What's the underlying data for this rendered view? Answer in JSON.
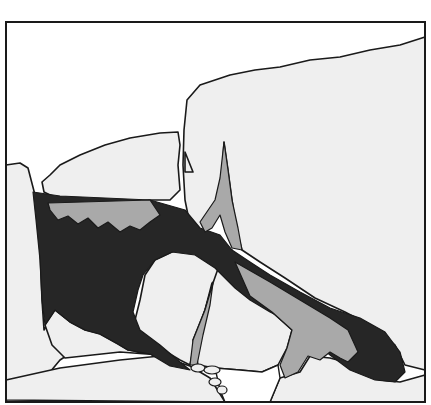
{
  "diagram": {
    "type": "line-drawing",
    "colors": {
      "background": "#ffffff",
      "stone_fill": "#efefef",
      "light_gray_fill": "#a9a9a9",
      "dark_fill": "#262626",
      "outline": "#1a1a1a",
      "gap_white": "#ffffff"
    },
    "frame": {
      "x": 6,
      "y": 22,
      "width": 419,
      "height": 380
    },
    "regions": [
      {
        "id": "dark-cavity",
        "fill": "dark_fill",
        "d": "M33,192 L60,196 L150,200 L185,210 L200,228 L220,235 L232,250 L250,262 L270,275 L300,292 L330,308 L360,318 L385,332 L400,352 L405,372 L395,382 L375,380 L350,370 L330,355 L310,338 L290,322 L270,312 L250,300 L235,288 L215,268 L195,255 L172,252 L155,260 L143,275 L138,290 L133,312 L140,330 L160,345 L180,362 L190,370 L170,366 L150,354 L128,350 L118,344 L100,334 L85,330 L70,322 L55,310 L45,325 L42,300 L40,260 L36,220 Z"
      },
      {
        "id": "gray-band-under-left-stone",
        "fill": "light_gray_fill",
        "d": "M48,203 L150,200 L160,215 L150,222 L140,230 L130,226 L120,232 L108,222 L98,228 L88,218 L78,224 L68,216 L58,220 L50,210 Z"
      },
      {
        "id": "gray-spike",
        "fill": "light_gray_fill",
        "d": "M224,142 L228,170 L232,200 L238,228 L242,250 L232,248 L225,232 L220,215 L212,228 L205,232 L200,222 L215,200 L220,178 Z"
      },
      {
        "id": "gray-right-wedge",
        "fill": "light_gray_fill",
        "d": "M235,262 L270,282 L300,300 L330,318 L348,330 L358,352 L348,362 L340,358 L330,352 L320,360 L308,356 L298,372 L285,378 L280,365 L287,348 L292,330 L272,312 L250,296 Z"
      },
      {
        "id": "gray-left-sliver",
        "fill": "light_gray_fill",
        "d": "M213,283 L205,310 L193,340 L190,365 L197,365 L203,335 L210,305 Z"
      }
    ],
    "stones": [
      {
        "id": "upper-right-megalith",
        "d": "M425,37 L400,45 L370,50 L340,57 L310,60 L280,67 L255,70 L230,75 L200,85 L187,100 L184,130 L183,165 L185,200 L190,225 L200,232 L210,225 L220,200 L222,175 L224,142 L228,170 L232,200 L236,228 L242,250 L260,262 L285,278 L315,298 L345,312 L375,328 L395,345 L405,365 L425,370 L425,37 Z"
      },
      {
        "id": "left-horizontal-stone",
        "d": "M50,175 L60,165 L80,155 L105,145 L130,138 L160,133 L178,132 L180,145 L178,165 L180,190 L170,200 L150,200 L120,203 L90,202 L60,200 L44,192 L42,182 Z"
      },
      {
        "id": "small-tab",
        "d": "M185,152 L193,172 L185,172 Z"
      },
      {
        "id": "left-pillar",
        "d": "M6,165 L20,163 L28,168 L35,195 L40,250 L42,300 L44,330 L55,310 L70,322 L85,330 L100,334 L60,360 L35,390 L6,400 Z"
      },
      {
        "id": "lower-left-block",
        "d": "M45,325 L55,310 L70,322 L85,330 L100,334 L118,344 L128,350 L150,354 L170,362 L185,365 L160,355 L120,352 L65,358 L52,345 Z"
      },
      {
        "id": "central-round-boulder",
        "d": "M172,252 L155,260 L145,275 L140,300 L135,320 L140,335 L160,348 L180,360 L190,365 L195,340 L205,310 L212,283 L232,266 L232,250 L215,245 L200,240 Z"
      },
      {
        "id": "center-lower-boulder",
        "d": "M220,263 L235,262 L252,296 L272,312 L292,330 L287,348 L278,365 L262,372 L240,370 L215,368 L198,365 L193,340 L205,310 L213,283 Z"
      },
      {
        "id": "ground-slope",
        "d": "M6,400 L6,380 L60,368 L120,360 L160,356 L190,366 L210,378 L225,402 Z"
      },
      {
        "id": "ground-right",
        "d": "M280,378 L300,372 L310,356 L330,358 L345,362 L360,370 L380,380 L400,382 L425,375 L425,402 L270,402 Z"
      }
    ],
    "small_pebbles": [
      {
        "cx": 198,
        "cy": 368,
        "rx": 7,
        "ry": 4
      },
      {
        "cx": 212,
        "cy": 370,
        "rx": 8,
        "ry": 4
      },
      {
        "cx": 215,
        "cy": 382,
        "rx": 6,
        "ry": 4
      },
      {
        "cx": 222,
        "cy": 390,
        "rx": 5,
        "ry": 4
      }
    ],
    "white_gap": {
      "d": "M215,368 L240,370 L262,372 L278,365 L280,378 L270,402 L225,402 L220,390 Z"
    }
  }
}
